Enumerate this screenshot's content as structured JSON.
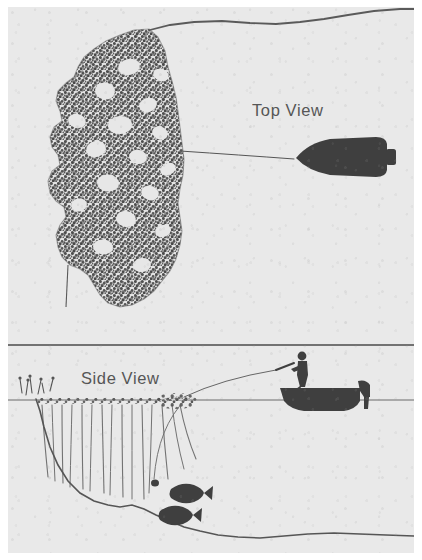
{
  "figure": {
    "kind": "fishing-technique-illustration",
    "background_color": "#e9e9e9",
    "ink_color": "#4a4a4a",
    "silhouette_color": "#3f3f3f",
    "panels": [
      {
        "id": "top-view",
        "label": "Top View",
        "contents": [
          "shoreline-contour",
          "weed-bed-mass",
          "weed-pockets",
          "boat-top-silhouette",
          "cast-line"
        ]
      },
      {
        "id": "side-view",
        "label": "Side View",
        "contents": [
          "waterline",
          "submerged-weed-stalks",
          "bottom-drop-off-contour",
          "lake-bottom-contour",
          "fish-silhouettes",
          "boat-side-silhouette",
          "angler-figure",
          "outboard-motor",
          "fishing-rod",
          "cast-line",
          "lure"
        ]
      }
    ],
    "labels": {
      "top_view": "Top View",
      "side_view": "Side View"
    },
    "counts": {
      "fish": 2,
      "weed_pockets": 17
    }
  }
}
